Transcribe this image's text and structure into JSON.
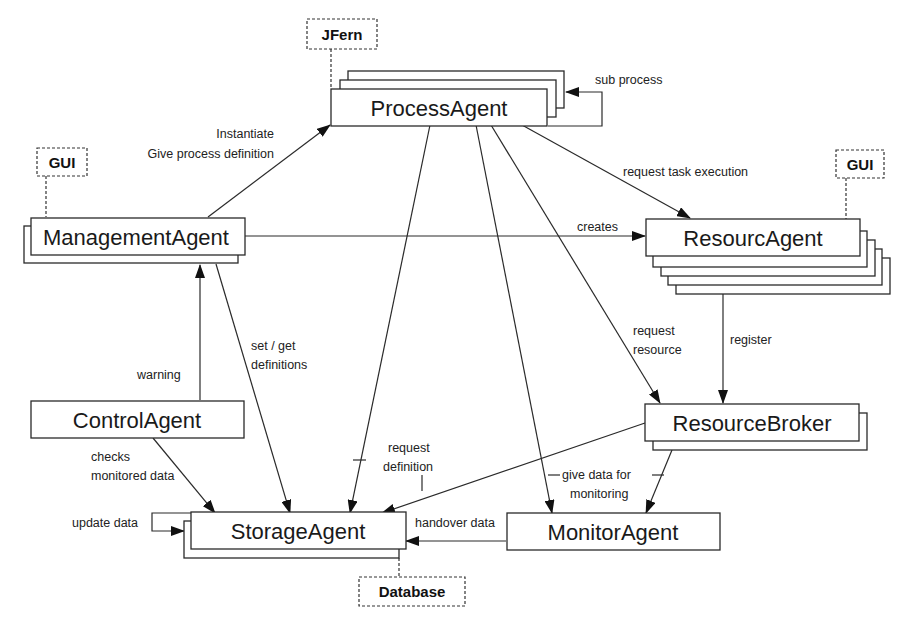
{
  "diagram": {
    "nodes": {
      "process_agent": "ProcessAgent",
      "management_agent": "ManagementAgent",
      "resource_agent": "ResourcAgent",
      "control_agent": "ControlAgent",
      "resource_broker": "ResourceBroker",
      "storage_agent": "StorageAgent",
      "monitor_agent": "MonitorAgent"
    },
    "external": {
      "jfern": "JFern",
      "gui_left": "GUI",
      "gui_right": "GUI",
      "database": "Database"
    },
    "edges": {
      "sub_process": "sub process",
      "instantiate": "Instantiate",
      "give_process_definition": "Give process definition",
      "request_task_execution": "request task execution",
      "creates": "creates",
      "request_resource_1": "request",
      "request_resource_2": "resource",
      "register": "register",
      "warning": "warning",
      "set_get_1": "set / get",
      "set_get_2": "definitions",
      "checks_1": "checks",
      "checks_2": "monitored data",
      "request_definition_1": "request",
      "request_definition_2": "definition",
      "give_data_1": "give data for",
      "give_data_2": "monitoring",
      "update_data": "update data",
      "handover_data": "handover data"
    }
  }
}
